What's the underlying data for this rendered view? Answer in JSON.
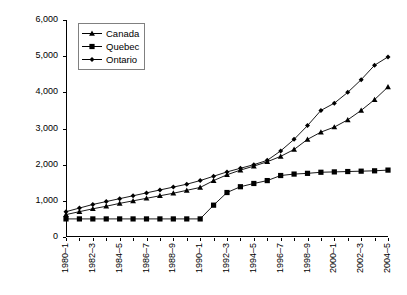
{
  "chart_data": {
    "type": "line",
    "title": "",
    "xlabel": "",
    "ylabel": "Current $/FTE",
    "ylim": [
      0,
      6000
    ],
    "ytick_labels": [
      "6,000",
      "5,000",
      "4,000",
      "3,000",
      "2,000",
      "1,000",
      "0"
    ],
    "ytick_values": [
      6000,
      5000,
      4000,
      3000,
      2000,
      1000,
      0
    ],
    "grid": false,
    "legend_position": "top-left",
    "x": [
      "1980–1",
      "1981–2",
      "1982–3",
      "1983–4",
      "1984–5",
      "1985–6",
      "1986–7",
      "1987–8",
      "1988–9",
      "1989–90",
      "1990–1",
      "1991–2",
      "1992–3",
      "1993–4",
      "1994–5",
      "1995–6",
      "1996–7",
      "1997–8",
      "1998–9",
      "1999–2000",
      "2000–1",
      "2001–2",
      "2002–3",
      "2003–4",
      "2004–5"
    ],
    "xtick_labels": [
      "1980–1",
      "1982–3",
      "1984–5",
      "1986–7",
      "1988–9",
      "1990–1",
      "1992–3",
      "1994–5",
      "1996–7",
      "1998–9",
      "2000–1",
      "2002–3",
      "2004–5"
    ],
    "xtick_indices": [
      0,
      2,
      4,
      6,
      8,
      10,
      12,
      14,
      16,
      18,
      20,
      22,
      24
    ],
    "series": [
      {
        "name": "Canada",
        "marker": "triangle",
        "color": "#000000",
        "values": [
          620,
          700,
          780,
          850,
          930,
          1000,
          1070,
          1140,
          1210,
          1290,
          1370,
          1560,
          1720,
          1850,
          1960,
          2080,
          2230,
          2420,
          2700,
          2900,
          3040,
          3240,
          3500,
          3800,
          4150
        ]
      },
      {
        "name": "Quebec",
        "marker": "square",
        "color": "#000000",
        "values": [
          500,
          500,
          500,
          500,
          500,
          500,
          500,
          500,
          500,
          500,
          500,
          880,
          1230,
          1390,
          1480,
          1560,
          1700,
          1740,
          1760,
          1790,
          1800,
          1810,
          1820,
          1830,
          1850
        ]
      },
      {
        "name": "Ontario",
        "marker": "diamond",
        "color": "#000000",
        "values": [
          700,
          800,
          900,
          980,
          1060,
          1140,
          1220,
          1300,
          1380,
          1460,
          1560,
          1680,
          1800,
          1900,
          2000,
          2120,
          2380,
          2700,
          3080,
          3500,
          3700,
          4000,
          4350,
          4750,
          4980
        ]
      }
    ]
  },
  "legend": {
    "items": [
      {
        "label": "Canada",
        "marker": "triangle"
      },
      {
        "label": "Quebec",
        "marker": "square"
      },
      {
        "label": "Ontario",
        "marker": "diamond"
      }
    ]
  }
}
